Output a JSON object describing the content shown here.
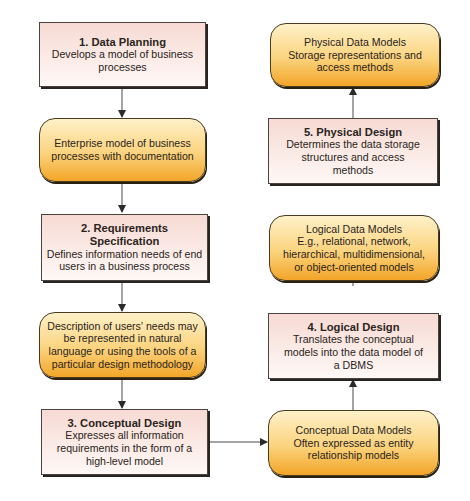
{
  "diagram": {
    "type": "flowchart",
    "colors": {
      "process_fill_top": "#f7dad3",
      "process_fill_bottom": "#fef8f6",
      "artifact_fill_top": "#fef1c9",
      "artifact_fill_bottom": "#f2a528",
      "border": "#4a4440",
      "arrow": "#3a3a3a"
    },
    "left_column": [
      {
        "id": "data-planning",
        "kind": "process",
        "title": "1. Data Planning",
        "lines": [
          "Develops a model of business",
          "processes"
        ]
      },
      {
        "id": "enterprise-model",
        "kind": "artifact",
        "lines": [
          "Enterprise model of business",
          "processes with documentation"
        ]
      },
      {
        "id": "requirements-specification",
        "kind": "process",
        "title": "2. Requirements Specification",
        "lines": [
          "Defines information needs of end",
          "users in a business process"
        ]
      },
      {
        "id": "users-needs-description",
        "kind": "artifact",
        "lines": [
          "Description of users' needs may",
          "be represented in natural",
          "language or using the tools of a",
          "particular design methodology"
        ]
      },
      {
        "id": "conceptual-design",
        "kind": "process",
        "title": "3. Conceptual Design",
        "lines": [
          "Expresses all information",
          "requirements in the form of a",
          "high-level model"
        ]
      }
    ],
    "right_column": [
      {
        "id": "physical-data-models",
        "kind": "artifact",
        "lines": [
          "Physical Data Models",
          "Storage representations and",
          "access methods"
        ]
      },
      {
        "id": "physical-design",
        "kind": "process",
        "title": "5. Physical Design",
        "lines": [
          "Determines the data storage",
          "structures and access",
          "methods"
        ]
      },
      {
        "id": "logical-data-models",
        "kind": "artifact",
        "lines": [
          "Logical Data Models",
          "E.g., relational, network,",
          "hierarchical, multidimensional,",
          "or object-oriented models"
        ]
      },
      {
        "id": "logical-design",
        "kind": "process",
        "title": "4. Logical Design",
        "lines": [
          "Translates the conceptual",
          "models into the data model of",
          "a DBMS"
        ]
      },
      {
        "id": "conceptual-data-models",
        "kind": "artifact",
        "lines": [
          "Conceptual Data Models",
          "Often expressed as entity",
          "relationship models"
        ]
      }
    ],
    "edges": [
      [
        "data-planning",
        "enterprise-model"
      ],
      [
        "enterprise-model",
        "requirements-specification"
      ],
      [
        "requirements-specification",
        "users-needs-description"
      ],
      [
        "users-needs-description",
        "conceptual-design"
      ],
      [
        "conceptual-design",
        "conceptual-data-models"
      ],
      [
        "conceptual-data-models",
        "logical-design"
      ],
      [
        "logical-design",
        "logical-data-models"
      ],
      [
        "logical-data-models",
        "physical-design"
      ],
      [
        "physical-design",
        "physical-data-models"
      ]
    ]
  }
}
